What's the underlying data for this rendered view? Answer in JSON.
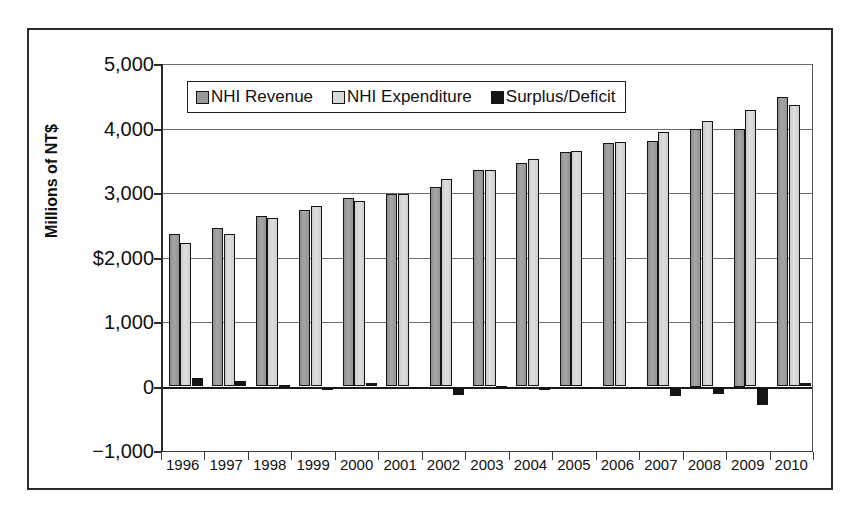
{
  "chart_data": {
    "type": "bar",
    "title": "",
    "xlabel": "",
    "ylabel": "Millions of NT$",
    "ylim": [
      -1000,
      5000
    ],
    "grid": true,
    "legend_position": "top-left-inside",
    "ytick_labels": [
      "5,000",
      "4,000",
      "3,000",
      "$2,000",
      "1,000",
      "0",
      "-1,000"
    ],
    "ytick_values": [
      5000,
      4000,
      3000,
      2000,
      1000,
      0,
      -1000
    ],
    "categories": [
      "1996",
      "1997",
      "1998",
      "1999",
      "2000",
      "2001",
      "2002",
      "2003",
      "2004",
      "2005",
      "2006",
      "2007",
      "2008",
      "2009",
      "2010"
    ],
    "series": [
      {
        "name": "NHI Revenue",
        "color": "#9a9a9a",
        "values": [
          2360,
          2450,
          2640,
          2740,
          2930,
          2980,
          3090,
          3350,
          3470,
          3640,
          3770,
          3810,
          4000,
          4000,
          4490
        ]
      },
      {
        "name": "NHI Expenditure",
        "color": "#d9d9d9",
        "values": [
          2230,
          2370,
          2620,
          2800,
          2870,
          2990,
          3220,
          3350,
          3520,
          3650,
          3790,
          3950,
          4110,
          4290,
          4370
        ]
      },
      {
        "name": "Surplus/Deficit",
        "color": "#141414",
        "values": [
          130,
          80,
          20,
          -60,
          60,
          -10,
          -130,
          10,
          -50,
          -10,
          -20,
          -140,
          -110,
          -290,
          60
        ]
      }
    ]
  }
}
